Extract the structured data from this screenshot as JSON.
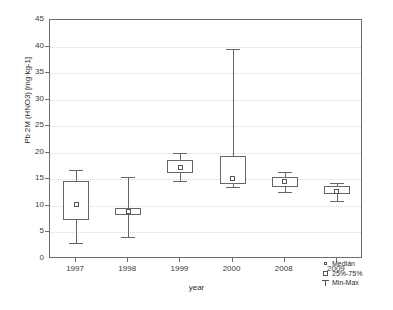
{
  "chart_data": {
    "type": "box",
    "title": "",
    "xlabel": "year",
    "ylabel": "Pb 2M (HNO3) [mg·kg-1]",
    "categories": [
      "1997",
      "1998",
      "1999",
      "2000",
      "2008",
      "2009"
    ],
    "ylim": [
      0,
      45
    ],
    "yticks": [
      0,
      5,
      10,
      15,
      20,
      25,
      30,
      35,
      40,
      45
    ],
    "grid": true,
    "legend_position": "bottom-right",
    "series": [
      {
        "name": "1997",
        "min": 3.0,
        "q1": 7.3,
        "median": 10.3,
        "q3": 14.7,
        "max": 16.8
      },
      {
        "name": "1998",
        "min": 4.2,
        "q1": 8.2,
        "median": 9.0,
        "q3": 9.6,
        "max": 15.5
      },
      {
        "name": "1999",
        "min": 14.6,
        "q1": 16.2,
        "median": 17.2,
        "q3": 18.6,
        "max": 20.0
      },
      {
        "name": "2000",
        "min": 13.5,
        "q1": 14.2,
        "median": 15.2,
        "q3": 19.4,
        "max": 39.5
      },
      {
        "name": "2008",
        "min": 12.6,
        "q1": 13.6,
        "median": 14.6,
        "q3": 15.4,
        "max": 16.4
      },
      {
        "name": "2009",
        "min": 11.0,
        "q1": 12.2,
        "median": 12.8,
        "q3": 13.7,
        "max": 14.4
      }
    ],
    "legend": [
      {
        "symbol": "median-marker",
        "label": "Medián"
      },
      {
        "symbol": "box-marker",
        "label": "25%-75%"
      },
      {
        "symbol": "whisker-marker",
        "label": "Min-Max"
      }
    ]
  },
  "colors": {
    "axis": "#6e6e6e",
    "grid": "#d8d8d8",
    "glyph": "#666666",
    "text": "#2b2b2b",
    "background": "#ffffff"
  }
}
